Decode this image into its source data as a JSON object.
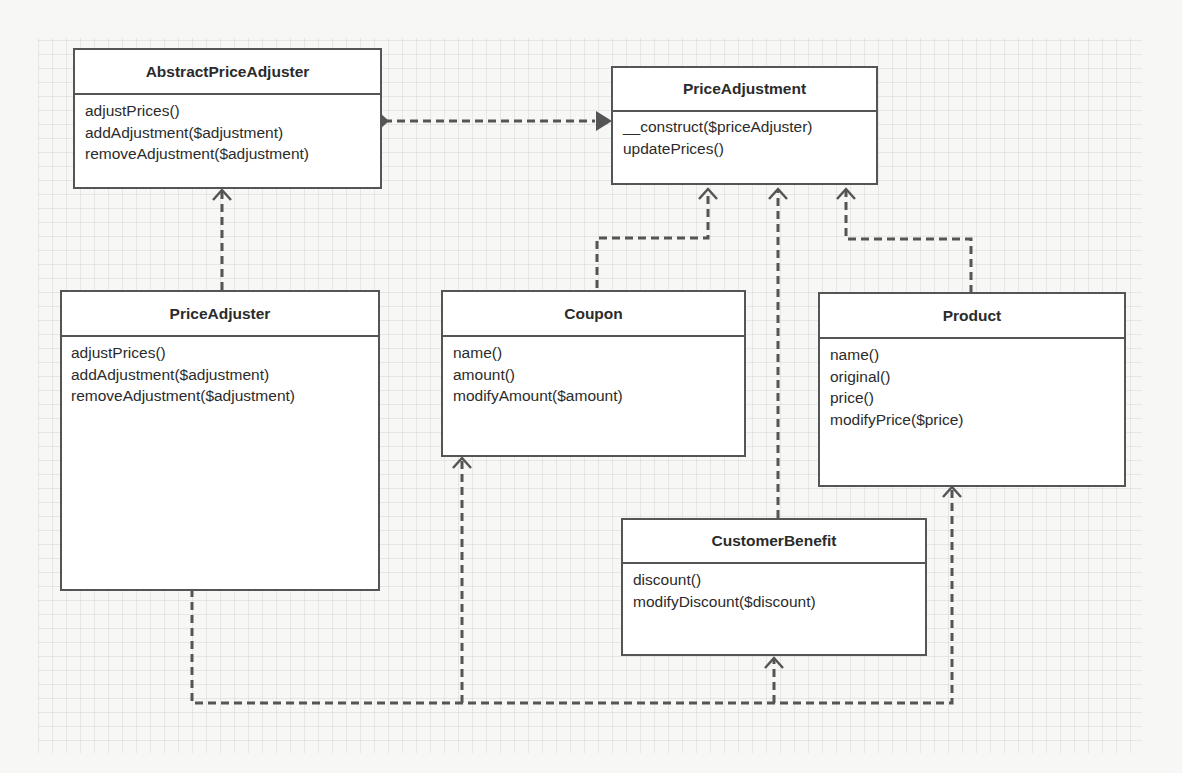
{
  "diagram": {
    "type": "uml-class-diagram",
    "classes": [
      {
        "id": "abstract_price_adjuster",
        "name": "AbstractPriceAdjuster",
        "operations": [
          "adjustPrices()",
          "addAdjustment($adjustment)",
          "removeAdjustment($adjustment)"
        ]
      },
      {
        "id": "price_adjustment",
        "name": "PriceAdjustment",
        "operations": [
          "__construct($priceAdjuster)",
          "updatePrices()"
        ]
      },
      {
        "id": "price_adjuster",
        "name": "PriceAdjuster",
        "operations": [
          "adjustPrices()",
          "addAdjustment($adjustment)",
          "removeAdjustment($adjustment)"
        ]
      },
      {
        "id": "coupon",
        "name": "Coupon",
        "operations": [
          "name()",
          "amount()",
          "modifyAmount($amount)"
        ]
      },
      {
        "id": "product",
        "name": "Product",
        "operations": [
          "name()",
          "original()",
          "price()",
          "modifyPrice($price)"
        ]
      },
      {
        "id": "customer_benefit",
        "name": "CustomerBenefit",
        "operations": [
          "discount()",
          "modifyDiscount($discount)"
        ]
      }
    ],
    "relationships": [
      {
        "from": "AbstractPriceAdjuster",
        "to": "PriceAdjustment",
        "style": "dashed",
        "ends": "diamond-arrow"
      },
      {
        "from": "PriceAdjuster",
        "to": "AbstractPriceAdjuster",
        "style": "dashed",
        "head": "open-arrow"
      },
      {
        "from": "Coupon",
        "to": "PriceAdjustment",
        "style": "dashed",
        "head": "open-arrow"
      },
      {
        "from": "CustomerBenefit",
        "to": "PriceAdjustment",
        "style": "dashed",
        "head": "open-arrow"
      },
      {
        "from": "Product",
        "to": "PriceAdjustment",
        "style": "dashed",
        "head": "open-arrow"
      },
      {
        "from": "PriceAdjuster",
        "to": "Coupon",
        "style": "dashed",
        "head": "open-arrow"
      },
      {
        "from": "PriceAdjuster",
        "to": "CustomerBenefit",
        "style": "dashed",
        "head": "open-arrow"
      },
      {
        "from": "PriceAdjuster",
        "to": "Product",
        "style": "dashed",
        "head": "open-arrow"
      }
    ],
    "colors": {
      "line": "#555555",
      "box_fill": "#ffffff",
      "background": "#f7f7f6"
    }
  }
}
